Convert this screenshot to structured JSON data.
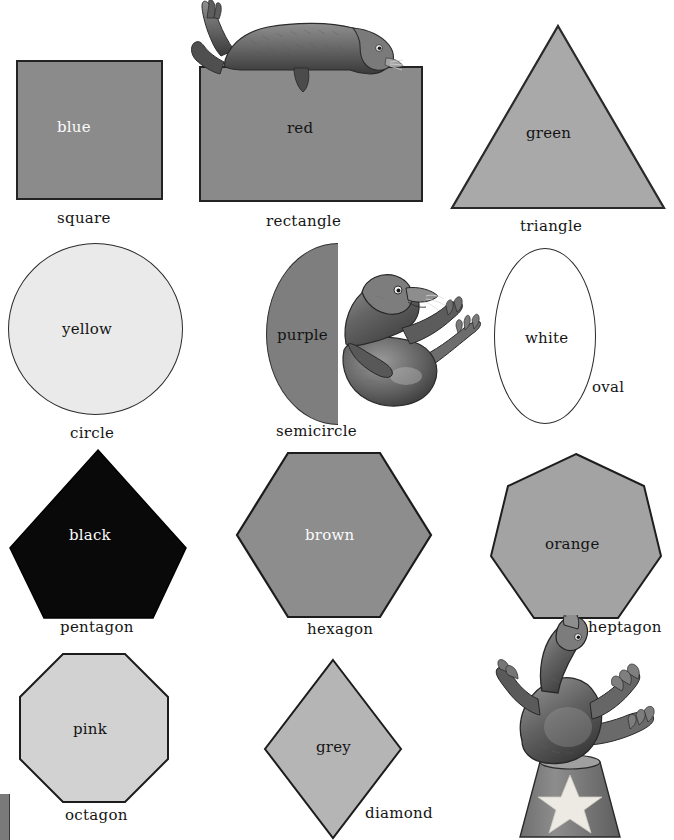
{
  "poster": {
    "title": "Shapes and Colors Chart",
    "background_color": "#ffffff",
    "columns": 3,
    "rows": 4
  },
  "palette": {
    "square_fill": "#8b8b8b",
    "rectangle_fill": "#8a8a8a",
    "triangle_fill": "#a9a9a9",
    "circle_fill": "#eaeaea",
    "semicircle_fill": "#7e7e7e",
    "oval_fill": "#ffffff",
    "pentagon_fill": "#090909",
    "hexagon_fill": "#8d8d8d",
    "heptagon_fill": "#a3a3a3",
    "octagon_fill": "#d2d2d2",
    "diamond_fill": "#b5b5b5",
    "outline": "#222222",
    "label_text": "#141414",
    "light_text": "#fbfbfb"
  },
  "items": [
    {
      "shape_label": "square",
      "color_word": "blue",
      "color_word_style": "light",
      "label_position": "below-center"
    },
    {
      "shape_label": "rectangle",
      "color_word": "red",
      "color_word_style": "dark",
      "label_position": "below-center"
    },
    {
      "shape_label": "triangle",
      "color_word": "green",
      "color_word_style": "dark",
      "label_position": "below-center"
    },
    {
      "shape_label": "circle",
      "color_word": "yellow",
      "color_word_style": "dark",
      "label_position": "below-center"
    },
    {
      "shape_label": "semicircle",
      "color_word": "purple",
      "color_word_style": "dark",
      "label_position": "below-center"
    },
    {
      "shape_label": "oval",
      "color_word": "white",
      "color_word_style": "dark",
      "label_position": "lower-right"
    },
    {
      "shape_label": "pentagon",
      "color_word": "black",
      "color_word_style": "light",
      "label_position": "below-center"
    },
    {
      "shape_label": "hexagon",
      "color_word": "brown",
      "color_word_style": "light",
      "label_position": "below-center"
    },
    {
      "shape_label": "heptagon",
      "color_word": "orange",
      "color_word_style": "dark",
      "label_position": "lower-right"
    },
    {
      "shape_label": "octagon",
      "color_word": "pink",
      "color_word_style": "dark",
      "label_position": "below-center"
    },
    {
      "shape_label": "diamond",
      "color_word": "grey",
      "color_word_style": "dark",
      "label_position": "lower-right"
    }
  ],
  "illustrations": [
    {
      "name": "seal-lying-on-rectangle",
      "description": "seal reclining on top of the rectangle"
    },
    {
      "name": "seal-sitting-beside-semicircle",
      "description": "seal sitting upright with flippers raised beside the semicircle"
    },
    {
      "name": "seal-balancing-on-drum",
      "description": "seal balancing on a star-decorated drum"
    }
  ]
}
